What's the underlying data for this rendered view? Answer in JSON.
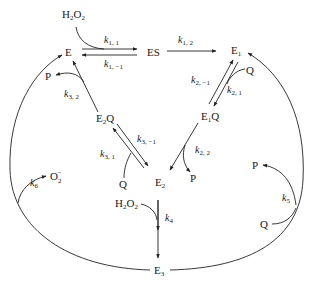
{
  "diagram": {
    "type": "reaction-mechanism",
    "species": {
      "E": "E",
      "ES": "ES",
      "E1": {
        "base": "E",
        "sub": "1"
      },
      "E1Q": {
        "base": "E",
        "sub": "1",
        "tail": "Q"
      },
      "E2Q": {
        "base": "E",
        "sub": "2",
        "tail": "Q"
      },
      "E2": {
        "base": "E",
        "sub": "2"
      },
      "E3": {
        "base": "E",
        "sub": "3"
      },
      "H2O2_top": {
        "a": "H",
        "s1": "2",
        "b": "O",
        "s2": "2"
      },
      "H2O2_mid": {
        "a": "H",
        "s1": "2",
        "b": "O",
        "s2": "2"
      },
      "P_left": "P",
      "P_mid": "P",
      "P_right": "P",
      "Q_top": "Q",
      "Q_mid": "Q",
      "Q_right": "Q",
      "O2_radical": {
        "base": "O",
        "sub": "2",
        "sup": "−"
      }
    },
    "rate_constants": {
      "k11": {
        "k": "k",
        "sub": "1, 1"
      },
      "k1m1": {
        "k": "k",
        "sub": "1, −1"
      },
      "k12": {
        "k": "k",
        "sub": "1, 2"
      },
      "k2m1": {
        "k": "k",
        "sub": "2, −1"
      },
      "k21": {
        "k": "k",
        "sub": "2, 1"
      },
      "k22": {
        "k": "k",
        "sub": "2, 2"
      },
      "k31": {
        "k": "k",
        "sub": "3, 1"
      },
      "k3m1": {
        "k": "k",
        "sub": "3, −1"
      },
      "k32": {
        "k": "k",
        "sub": "3, 2"
      },
      "k4": {
        "k": "k",
        "sub": "4"
      },
      "k5": {
        "k": "k",
        "sub": "5"
      },
      "k6": {
        "k": "k",
        "sub": "6"
      }
    },
    "edges": [
      {
        "from": "E",
        "to": "ES",
        "rate": "k11",
        "reagent": "H2O2",
        "reversible": true,
        "reverse_rate": "k1m1"
      },
      {
        "from": "ES",
        "to": "E1",
        "rate": "k12"
      },
      {
        "from": "E1",
        "to": "E1Q",
        "rate": "k21",
        "reagent": "Q",
        "reversible": true,
        "reverse_rate": "k2m1"
      },
      {
        "from": "E1Q",
        "to": "E2",
        "rate": "k22",
        "product": "P"
      },
      {
        "from": "E2",
        "to": "E2Q",
        "rate": "k31",
        "reagent": "Q",
        "reversible": true,
        "reverse_rate": "k3m1"
      },
      {
        "from": "E2Q",
        "to": "E",
        "rate": "k32",
        "product": "P"
      },
      {
        "from": "E2",
        "to": "E3",
        "rate": "k4",
        "reagent": "H2O2"
      },
      {
        "from": "E3",
        "to": "E1",
        "rate": "k5",
        "reagent": "Q",
        "product": "P"
      },
      {
        "from": "E3",
        "to": "E",
        "rate": "k6",
        "product": "O2−"
      }
    ]
  }
}
